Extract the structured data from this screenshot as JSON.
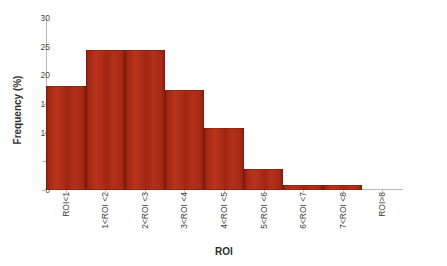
{
  "chart_data": {
    "type": "bar",
    "title": "",
    "xlabel": "ROI",
    "ylabel": "Frequency (%)",
    "categories": [
      "ROI<1",
      "1<ROI <2",
      "2<ROI <3",
      "3<ROI <4",
      "4<ROI <5",
      "5<ROI <6",
      "6<ROI <7",
      "7<ROI <8",
      "ROI>8"
    ],
    "values": [
      18.2,
      24.4,
      24.4,
      17.4,
      10.9,
      3.6,
      0.9,
      0.9,
      0.0
    ],
    "ylim": [
      0,
      30
    ],
    "yticks": [
      0,
      5,
      10,
      15,
      20,
      25,
      30
    ],
    "ytick_labels": [
      "0",
      "5",
      "10",
      "15",
      "20",
      "25",
      "30"
    ],
    "grid": false,
    "legend": false,
    "bar_color": "#a82a15",
    "bar_color_dark": "#8d1f10",
    "axis_color": "#b9b9b9",
    "background": "#ffffff"
  }
}
